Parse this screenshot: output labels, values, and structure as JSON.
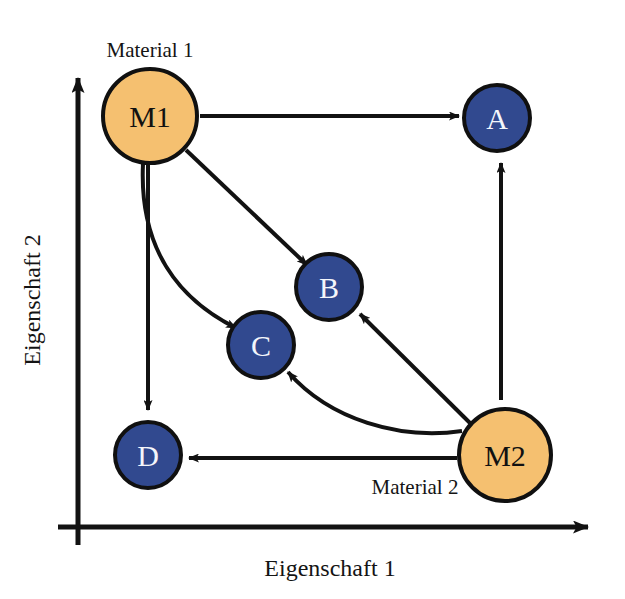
{
  "figure": {
    "background_color": "#ffffff",
    "axes": {
      "x_axis_label": "Eigenschaft 1",
      "y_axis_label": "Eigenschaft 2",
      "axis_color": "#121212",
      "origin": {
        "x": 78,
        "y": 527
      },
      "x_end": {
        "x": 600,
        "y": 527
      },
      "y_end": {
        "x": 78,
        "y": 67
      }
    },
    "annotations": [
      {
        "id": "label-material-1",
        "text": "Material 1",
        "x": 150,
        "y": 57
      },
      {
        "id": "label-material-2",
        "text": "Material 2",
        "x": 415,
        "y": 494
      }
    ],
    "nodes": [
      {
        "id": "M1",
        "label": "M1",
        "x": 150,
        "y": 116,
        "r": 47,
        "fill": "#f5c070",
        "stroke": "#101010",
        "text_color": "#111111",
        "kind": "material"
      },
      {
        "id": "M2",
        "label": "M2",
        "x": 505,
        "y": 455,
        "r": 46,
        "fill": "#f5c070",
        "stroke": "#101010",
        "text_color": "#111111",
        "kind": "material"
      },
      {
        "id": "A",
        "label": "A",
        "x": 497,
        "y": 118,
        "r": 33,
        "fill": "#31498f",
        "stroke": "#101010",
        "text_color": "#f4f6fb",
        "kind": "product"
      },
      {
        "id": "B",
        "label": "B",
        "x": 329,
        "y": 287,
        "r": 33,
        "fill": "#31498f",
        "stroke": "#101010",
        "text_color": "#f4f6fb",
        "kind": "product"
      },
      {
        "id": "C",
        "label": "C",
        "x": 261,
        "y": 345,
        "r": 33,
        "fill": "#31498f",
        "stroke": "#101010",
        "text_color": "#f4f6fb",
        "kind": "product"
      },
      {
        "id": "D",
        "label": "D",
        "x": 148,
        "y": 455,
        "r": 33,
        "fill": "#31498f",
        "stroke": "#101010",
        "text_color": "#f4f6fb",
        "kind": "product"
      }
    ],
    "edges": [
      {
        "id": "edge-m1-a",
        "from": "M1",
        "to": "A",
        "style": "straight",
        "path": "M 200,116 L 459,116",
        "color": "#121212"
      },
      {
        "id": "edge-m1-b",
        "from": "M1",
        "to": "B",
        "style": "straight",
        "path": "M 186,150 L 307,265",
        "color": "#121212"
      },
      {
        "id": "edge-m1-c",
        "from": "M1",
        "to": "C",
        "style": "curved",
        "path": "M 143,164 C 139,250 180,300 236,328",
        "color": "#121212"
      },
      {
        "id": "edge-m1-d",
        "from": "M1",
        "to": "D",
        "style": "straight",
        "path": "M 148,164 L 148,410",
        "color": "#121212"
      },
      {
        "id": "edge-m2-a",
        "from": "M2",
        "to": "A",
        "style": "straight",
        "path": "M 501,400 L 501,163",
        "color": "#121212"
      },
      {
        "id": "edge-m2-b",
        "from": "M2",
        "to": "B",
        "style": "straight",
        "path": "M 470,423 L 360,314",
        "color": "#121212"
      },
      {
        "id": "edge-m2-c",
        "from": "M2",
        "to": "C",
        "style": "curved",
        "path": "M 462,431 C 400,440 330,420 288,372",
        "color": "#121212"
      },
      {
        "id": "edge-m2-d",
        "from": "M2",
        "to": "D",
        "style": "straight",
        "path": "M 457,458 L 189,458",
        "color": "#121212"
      }
    ]
  }
}
